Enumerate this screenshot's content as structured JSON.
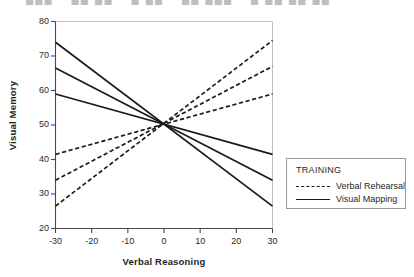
{
  "top_strip": {
    "clipped_text": "███ – ██ ██ – █ ██ – ██ ███ – █ ██ ██ ██"
  },
  "chart_data": {
    "type": "line",
    "title": "",
    "xlabel": "Verbal Reasoning",
    "ylabel": "Visual Memory",
    "xlim": [
      -30,
      30
    ],
    "ylim": [
      20,
      80
    ],
    "xticks": [
      -30,
      -20,
      -10,
      0,
      10,
      20,
      30
    ],
    "yticks": [
      20,
      30,
      40,
      50,
      60,
      70,
      80
    ],
    "xtick_labels": [
      "-30",
      "-20",
      "-10",
      "0",
      "10",
      "20",
      "30"
    ],
    "ytick_labels": [
      "20",
      "30",
      "40",
      "50",
      "60",
      "70",
      "80"
    ],
    "grid": false,
    "legend_position": "right-outside",
    "legend_title": "TRAINING",
    "x": [
      -30,
      30
    ],
    "series": [
      {
        "name": "Verbal Rehearsal",
        "style": "dashed",
        "color": "#1a1a1a",
        "values": [
          26.5,
          74.5
        ]
      },
      {
        "name": "Verbal Rehearsal",
        "style": "dashed",
        "color": "#1a1a1a",
        "values": [
          34.0,
          67.0
        ]
      },
      {
        "name": "Verbal Rehearsal",
        "style": "dashed",
        "color": "#1a1a1a",
        "values": [
          41.5,
          59.0
        ]
      },
      {
        "name": "Visual Mapping",
        "style": "solid",
        "color": "#1a1a1a",
        "values": [
          59.0,
          41.5
        ]
      },
      {
        "name": "Visual Mapping",
        "style": "solid",
        "color": "#1a1a1a",
        "values": [
          66.5,
          34.0
        ]
      },
      {
        "name": "Visual Mapping",
        "style": "solid",
        "color": "#1a1a1a",
        "values": [
          74.0,
          26.5
        ]
      }
    ],
    "legend": [
      {
        "label": "Verbal Rehearsal",
        "style": "dashed"
      },
      {
        "label": "Visual Mapping",
        "style": "solid"
      }
    ]
  }
}
